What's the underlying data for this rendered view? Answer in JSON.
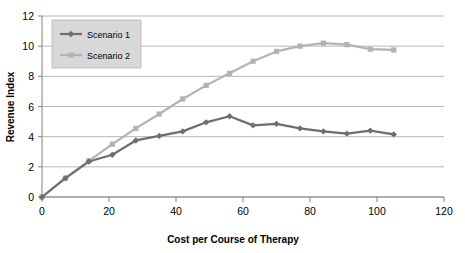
{
  "chart_data": {
    "type": "line",
    "title": "",
    "xlabel": "Cost per Course of Therapy",
    "ylabel": "Revenue Index",
    "xlim": [
      0,
      120
    ],
    "ylim": [
      0,
      12
    ],
    "xticks": [
      0,
      20,
      40,
      60,
      80,
      100,
      120
    ],
    "yticks": [
      0,
      2,
      4,
      6,
      8,
      10,
      12
    ],
    "grid": "horizontal",
    "legend_position": "top-left-inside",
    "x": [
      0,
      7,
      14,
      21,
      28,
      35,
      42,
      49,
      56,
      63,
      70,
      77,
      84,
      91,
      98,
      105
    ],
    "series": [
      {
        "name": "Scenario 1",
        "color": "#6e6e6e",
        "marker": "diamond",
        "values": [
          0,
          1.25,
          2.35,
          2.8,
          3.75,
          4.05,
          4.35,
          4.95,
          5.35,
          4.75,
          4.85,
          4.55,
          4.35,
          4.2,
          4.4,
          4.15
        ]
      },
      {
        "name": "Scenario 2",
        "color": "#b3b3b3",
        "marker": "square",
        "values": [
          0,
          1.25,
          2.4,
          3.5,
          4.55,
          5.5,
          6.5,
          7.4,
          8.2,
          9.0,
          9.65,
          10.0,
          10.2,
          10.1,
          9.8,
          9.75
        ]
      }
    ]
  },
  "legend": {
    "items": [
      {
        "label": "Scenario 1"
      },
      {
        "label": "Scenario 2"
      }
    ]
  },
  "axes": {
    "x_title": "Cost per Course of Therapy",
    "y_title": "Revenue Index",
    "x_tick_labels": [
      "0",
      "20",
      "40",
      "60",
      "80",
      "100",
      "120"
    ],
    "y_tick_labels": [
      "0",
      "2",
      "4",
      "6",
      "8",
      "10",
      "12"
    ]
  },
  "colors": {
    "series1": "#6e6e6e",
    "series2": "#b3b3b3",
    "grid": "#9a9a9a",
    "axis": "#808080",
    "legend_bg": "#d8d8d8",
    "text": "#000000",
    "background": "#ffffff"
  }
}
